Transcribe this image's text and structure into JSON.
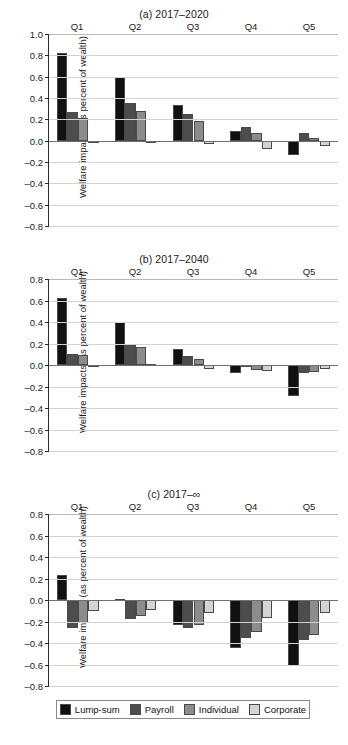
{
  "figure": {
    "axis_title": "Welfare impacts (as percent of wealth)",
    "footer_note": ""
  },
  "legend": {
    "position": "bottom",
    "items": [
      {
        "label": "Lump-sum",
        "color": "#111111"
      },
      {
        "label": "Payroll",
        "color": "#4d4d4d"
      },
      {
        "label": "Individual",
        "color": "#8c8c8c"
      },
      {
        "label": "Corporate",
        "color": "#d4d4d4"
      }
    ]
  },
  "chart_data": [
    {
      "type": "bar",
      "title": "(a) 2017–2020",
      "xlabel": "",
      "ylabel": "Welfare impacts (as percent of wealth)",
      "categories": [
        "Q1",
        "Q2",
        "Q3",
        "Q4",
        "Q5"
      ],
      "ylim": [
        -0.8,
        1.0
      ],
      "yticks": [
        1.0,
        0.8,
        0.6,
        0.4,
        0.2,
        0.0,
        -0.2,
        -0.4,
        -0.6,
        -0.8
      ],
      "yticklabels": [
        "1.0",
        "0.8",
        "0.6",
        "0.4",
        "0.2",
        "0.0",
        "–0.2",
        "–0.4",
        "–0.6",
        "–0.8"
      ],
      "grid": true,
      "series": [
        {
          "name": "Lump-sum",
          "values": [
            0.82,
            0.6,
            0.33,
            0.09,
            -0.13
          ]
        },
        {
          "name": "Payroll",
          "values": [
            0.27,
            0.355,
            0.25,
            0.13,
            0.07
          ]
        },
        {
          "name": "Individual",
          "values": [
            0.21,
            0.275,
            0.18,
            0.075,
            0.025
          ]
        },
        {
          "name": "Corporate",
          "values": [
            -0.015,
            -0.008,
            -0.03,
            -0.08,
            -0.05
          ]
        }
      ]
    },
    {
      "type": "bar",
      "title": "(b) 2017–2040",
      "xlabel": "",
      "ylabel": "Welfare impacts (as percent of wealth)",
      "categories": [
        "Q1",
        "Q2",
        "Q3",
        "Q4",
        "Q5"
      ],
      "ylim": [
        -0.8,
        0.8
      ],
      "yticks": [
        0.8,
        0.6,
        0.4,
        0.2,
        0.0,
        -0.2,
        -0.4,
        -0.6,
        -0.8
      ],
      "yticklabels": [
        "0.8",
        "0.6",
        "0.4",
        "0.2",
        "0.0",
        "–0.2",
        "–0.4",
        "–0.6",
        "–0.8"
      ],
      "grid": true,
      "series": [
        {
          "name": "Lump-sum",
          "values": [
            0.62,
            0.4,
            0.145,
            -0.075,
            -0.285
          ]
        },
        {
          "name": "Payroll",
          "values": [
            0.105,
            0.19,
            0.08,
            -0.015,
            -0.075
          ]
        },
        {
          "name": "Individual",
          "values": [
            0.09,
            0.165,
            0.06,
            -0.045,
            -0.065
          ]
        },
        {
          "name": "Corporate",
          "values": [
            -0.02,
            0.01,
            -0.035,
            -0.055,
            -0.04
          ]
        }
      ]
    },
    {
      "type": "bar",
      "title": "(c) 2017–∞",
      "xlabel": "",
      "ylabel": "Welfare impacts (as percent of wealth)",
      "categories": [
        "Q1",
        "Q2",
        "Q3",
        "Q4",
        "Q5"
      ],
      "ylim": [
        -0.8,
        0.8
      ],
      "yticks": [
        0.8,
        0.6,
        0.4,
        0.2,
        0.0,
        -0.2,
        -0.4,
        -0.6,
        -0.8
      ],
      "yticklabels": [
        "0.8",
        "0.6",
        "0.4",
        "0.2",
        "0.0",
        "–0.2",
        "–0.4",
        "–0.6",
        "–0.8"
      ],
      "grid": true,
      "series": [
        {
          "name": "Lump-sum",
          "values": [
            0.23,
            0.008,
            -0.235,
            -0.445,
            -0.615
          ]
        },
        {
          "name": "Payroll",
          "values": [
            -0.26,
            -0.175,
            -0.265,
            -0.35,
            -0.375
          ]
        },
        {
          "name": "Individual",
          "values": [
            -0.21,
            -0.145,
            -0.23,
            -0.295,
            -0.33
          ]
        },
        {
          "name": "Corporate",
          "values": [
            -0.105,
            -0.095,
            -0.125,
            -0.165,
            -0.125
          ]
        }
      ]
    }
  ]
}
